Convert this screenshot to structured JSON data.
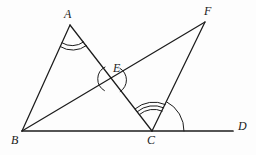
{
  "figure": {
    "kind": "geometry-diagram",
    "width": 256,
    "height": 155,
    "background_color": "#fdfdfd",
    "stroke_color": "#1c1c1c"
  },
  "labels": {
    "a": "A",
    "b": "B",
    "c": "C",
    "d": "D",
    "e": "E",
    "f": "F"
  },
  "points": {
    "A": {
      "x": 70,
      "y": 25
    },
    "B": {
      "x": 22,
      "y": 131
    },
    "C": {
      "x": 152,
      "y": 131
    },
    "D": {
      "x": 233,
      "y": 131
    },
    "E": {
      "x": 112,
      "y": 79
    },
    "F": {
      "x": 205,
      "y": 22
    }
  },
  "label_positions": {
    "A": {
      "x": 64,
      "y": 8
    },
    "B": {
      "x": 11,
      "y": 134
    },
    "C": {
      "x": 147,
      "y": 134
    },
    "D": {
      "x": 238,
      "y": 120
    },
    "E": {
      "x": 113,
      "y": 62
    },
    "F": {
      "x": 204,
      "y": 5
    }
  },
  "segments": [
    {
      "name": "segment-AB",
      "from": "A",
      "to": "B"
    },
    {
      "name": "segment-AC",
      "from": "A",
      "to": "C"
    },
    {
      "name": "segment-BF",
      "from": "B",
      "to": "F"
    },
    {
      "name": "segment-CF",
      "from": "C",
      "to": "F"
    },
    {
      "name": "segment-BD",
      "from": "B",
      "to": "D"
    }
  ],
  "angle_marks": [
    {
      "name": "angle-mark-A",
      "vertex": "A",
      "arcs": 2,
      "note": "double arc at apex A between AB and AC"
    },
    {
      "name": "angle-mark-E-left",
      "vertex": "E",
      "arcs": 1,
      "note": "arc opening left at intersection E"
    },
    {
      "name": "angle-mark-E-right",
      "vertex": "E",
      "arcs": 1,
      "note": "arc opening right at intersection E"
    },
    {
      "name": "angle-mark-C-inner",
      "vertex": "C",
      "arcs": 3,
      "note": "triple arc between CA and CF"
    },
    {
      "name": "angle-mark-C-outer",
      "vertex": "C",
      "arcs": 1,
      "note": "large arc from CF to ray CD"
    }
  ]
}
